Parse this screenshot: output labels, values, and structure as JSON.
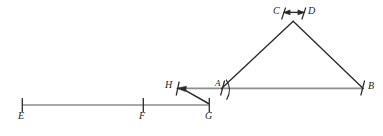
{
  "figure": {
    "kind": "geometry-construction-diagram",
    "background_color": "#ffffff",
    "segment_color": "#8a8a8a",
    "stroke_color": "#2b2b2b",
    "tick_color": "#2b2b2b",
    "canvas": {
      "width": 383,
      "height": 136
    },
    "labels": {
      "E": "E",
      "F": "F",
      "G": "G",
      "H": "H",
      "A": "A",
      "B": "B",
      "C": "C",
      "D": "D"
    },
    "label_positions": {
      "E": {
        "x": 18,
        "y": 116
      },
      "F": {
        "x": 139,
        "y": 116
      },
      "G": {
        "x": 205,
        "y": 116
      },
      "H": {
        "x": 165,
        "y": 84
      },
      "A": {
        "x": 215,
        "y": 82
      },
      "B": {
        "x": 368,
        "y": 84
      },
      "C": {
        "x": 274,
        "y": 7
      },
      "D": {
        "x": 308,
        "y": 7
      }
    },
    "points": {
      "E": {
        "x": 22,
        "y": 105
      },
      "F": {
        "x": 143,
        "y": 105
      },
      "G": {
        "x": 209,
        "y": 105
      },
      "H": {
        "x": 177,
        "y": 88
      },
      "A": {
        "x": 222,
        "y": 88
      },
      "B": {
        "x": 363,
        "y": 88
      },
      "apex": {
        "x": 293,
        "y": 21
      }
    },
    "segments": [
      {
        "name": "segment-EG-baseline",
        "from": "E",
        "to": "G"
      },
      {
        "name": "segment-HB-baseline",
        "from": "H",
        "to": "B"
      },
      {
        "name": "segment-GH-connector",
        "from": "G",
        "to": "H"
      },
      {
        "name": "segment-A-apex-left-leg",
        "from": "A",
        "to": "apex"
      },
      {
        "name": "segment-apex-B-right-leg",
        "from": "apex",
        "to": "B"
      }
    ],
    "tick_marks": [
      {
        "name": "tick-E",
        "at": "E",
        "style": "vertical"
      },
      {
        "name": "tick-F",
        "at": "F",
        "style": "vertical"
      },
      {
        "name": "tick-G",
        "at": "G",
        "style": "vertical"
      },
      {
        "name": "tick-H",
        "at": "H",
        "style": "slanted"
      },
      {
        "name": "tick-A",
        "at": "A",
        "style": "slanted"
      },
      {
        "name": "tick-B",
        "at": "B",
        "style": "slanted"
      },
      {
        "name": "tick-apex-left",
        "at": "apex",
        "style": "slanted"
      },
      {
        "name": "tick-apex-right",
        "at": "apex",
        "style": "slanted"
      }
    ],
    "arcs": [
      {
        "name": "arc-angle-A",
        "at": "A"
      }
    ],
    "arrows": [
      {
        "name": "arrowhead-at-H",
        "at": "H",
        "direction": "left"
      },
      {
        "name": "double-arrow-apex",
        "at": "apex",
        "direction": "horizontal"
      }
    ]
  }
}
